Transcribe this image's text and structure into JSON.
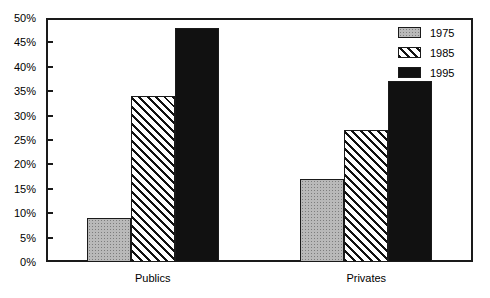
{
  "chart_data": {
    "type": "bar",
    "title": "",
    "subtitle": "",
    "xlabel": "",
    "ylabel": "",
    "categories": [
      "Publics",
      "Privates"
    ],
    "series": [
      {
        "name": "1975",
        "values": [
          9,
          17
        ],
        "pattern": "stipple-gray",
        "color": "#b9b9b9"
      },
      {
        "name": "1985",
        "values": [
          34,
          27
        ],
        "pattern": "diagonal-hatch",
        "color": "#ffffff"
      },
      {
        "name": "1995",
        "values": [
          48,
          37
        ],
        "pattern": "solid-black",
        "color": "#111111"
      }
    ],
    "ylim": [
      0,
      50
    ],
    "ytick_labels": [
      "0%",
      "5%",
      "10%",
      "15%",
      "20%",
      "25%",
      "30%",
      "35%",
      "40%",
      "45%",
      "50%"
    ],
    "ytick_values": [
      0,
      5,
      10,
      15,
      20,
      25,
      30,
      35,
      40,
      45,
      50
    ],
    "grid": false,
    "legend_position": "top-right-inside",
    "frame": true,
    "axis_color": "#1a1a1a"
  }
}
